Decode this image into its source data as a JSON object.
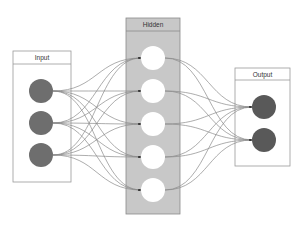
{
  "diagram": {
    "type": "neural-network",
    "layers": [
      {
        "id": "input",
        "label": "Input",
        "node_count": 3,
        "node_color": "#6e6e6e",
        "box_fill": "#ffffff"
      },
      {
        "id": "hidden",
        "label": "Hidden",
        "node_count": 5,
        "node_color": "#ffffff",
        "box_fill": "#c8c8c8"
      },
      {
        "id": "output",
        "label": "Output",
        "node_count": 2,
        "node_color": "#595959",
        "box_fill": "#ffffff"
      }
    ],
    "connections": "fully-connected",
    "colors": {
      "box_border": "#9a9a9a",
      "edge": "#8a8a8a",
      "arrowhead": "#333333"
    }
  }
}
